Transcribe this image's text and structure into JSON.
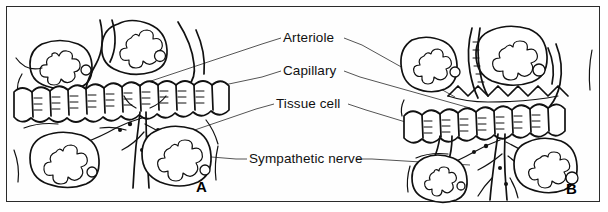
{
  "figure": {
    "type": "scientific-line-drawing",
    "background_color": "#ffffff",
    "border_color": "#2b2b2b",
    "ink_color": "#111111"
  },
  "labels": {
    "arteriole": "Arteriole",
    "capillary": "Capillary",
    "tissue_cell": "Tissue cell",
    "sympathetic_nerve": "Sympathetic nerve"
  },
  "panels": [
    {
      "id": "A",
      "label": "A",
      "state": "dilated"
    },
    {
      "id": "B",
      "label": "B",
      "state": "constricted"
    }
  ]
}
